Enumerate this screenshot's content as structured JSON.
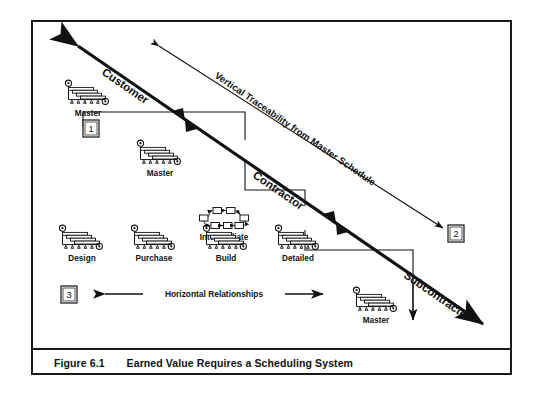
{
  "figure": {
    "caption_number": "Figure 6.1",
    "caption_title": "Earned Value Requires a Scheduling System",
    "border_color": "#1a1a1a",
    "background": "#ffffff"
  },
  "diagonal_axis": {
    "label_top": "Customer",
    "label_middle": "Contractor",
    "label_bottom": "Subcontractor"
  },
  "annotation_arrow": {
    "label": "Vertical Traceability from Master Schedule"
  },
  "horizontal_arrow": {
    "label": "Horizontal Relationships"
  },
  "callouts": [
    {
      "id": "callout-1",
      "text": "1"
    },
    {
      "id": "callout-2",
      "text": "2"
    },
    {
      "id": "callout-3",
      "text": "3"
    }
  ],
  "schedule_nodes": [
    {
      "id": "node-customer-master",
      "label": "Master",
      "icon": "gantt-chart-icon",
      "tier": "customer"
    },
    {
      "id": "node-contractor-master",
      "label": "Master",
      "icon": "gantt-chart-icon",
      "tier": "contractor"
    },
    {
      "id": "node-intermediate",
      "label": "Intermediate",
      "icon": "network-diagram-icon",
      "tier": "contractor"
    },
    {
      "id": "node-design",
      "label": "Design",
      "icon": "gantt-chart-icon",
      "tier": "detail"
    },
    {
      "id": "node-purchase",
      "label": "Purchase",
      "icon": "gantt-chart-icon",
      "tier": "detail"
    },
    {
      "id": "node-build",
      "label": "Build",
      "icon": "gantt-chart-icon",
      "tier": "detail"
    },
    {
      "id": "node-detailed",
      "label": "Detailed",
      "icon": "gantt-chart-icon",
      "tier": "detail"
    },
    {
      "id": "node-subcontractor-master",
      "label": "Master",
      "icon": "gantt-chart-icon",
      "tier": "subcontractor"
    }
  ]
}
